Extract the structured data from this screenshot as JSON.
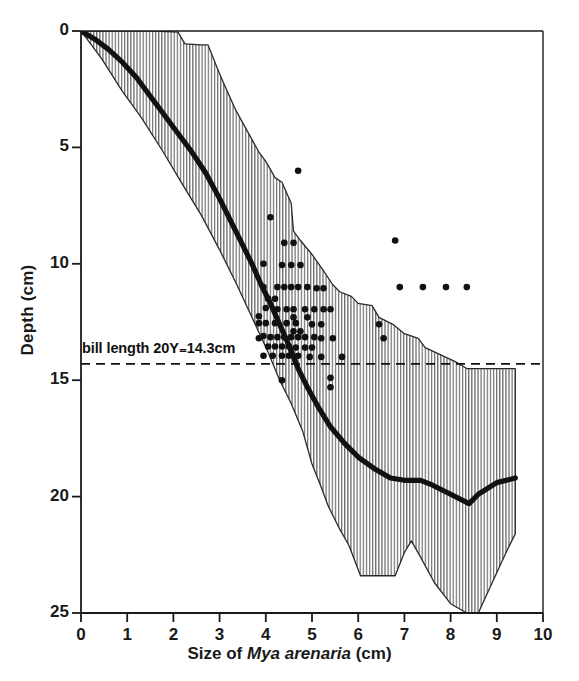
{
  "chart_data": {
    "type": "area",
    "title": "",
    "xlabel": "Size of Mya arenaria (cm)",
    "xlabel_parts": {
      "pre": "Size of ",
      "italic": "Mya arenaria",
      "post": " (cm)"
    },
    "ylabel": "Depth (cm)",
    "xlim": [
      0,
      10
    ],
    "ylim": [
      25,
      0
    ],
    "y_inverted": true,
    "grid": false,
    "legend": null,
    "xticks": [
      0,
      1,
      2,
      3,
      4,
      5,
      6,
      7,
      8,
      9,
      10
    ],
    "xtick_labels": [
      "0",
      "1",
      "2",
      "3",
      "4",
      "5",
      "6",
      "7",
      "8",
      "9",
      "10"
    ],
    "yticks": [
      0,
      5,
      10,
      15,
      20,
      25
    ],
    "ytick_labels": [
      "0",
      "5",
      "10",
      "15",
      "20",
      "25"
    ],
    "annotations": [
      {
        "name": "bill-length-line",
        "text": "bill length 20Y₌14.3cm",
        "type": "hline",
        "y": 14.3,
        "style": "dashed",
        "label_x": 0.05
      }
    ],
    "series": [
      {
        "name": "burial depth envelope (range)",
        "type": "band",
        "fill": "vertical-hatch",
        "upper": [
          [
            0.0,
            0.0
          ],
          [
            1.6,
            0.0
          ],
          [
            2.1,
            0.05
          ],
          [
            2.25,
            0.55
          ],
          [
            2.6,
            0.6
          ],
          [
            2.75,
            0.6
          ],
          [
            2.95,
            1.6
          ],
          [
            3.1,
            2.3
          ],
          [
            3.35,
            3.4
          ],
          [
            3.6,
            4.3
          ],
          [
            3.85,
            5.2
          ],
          [
            4.0,
            5.6
          ],
          [
            4.2,
            6.3
          ],
          [
            4.35,
            6.5
          ],
          [
            4.55,
            7.4
          ],
          [
            4.6,
            8.6
          ],
          [
            4.75,
            9.0
          ],
          [
            5.0,
            9.6
          ],
          [
            5.25,
            10.3
          ],
          [
            5.45,
            10.9
          ],
          [
            5.6,
            11.2
          ],
          [
            5.85,
            11.4
          ],
          [
            6.0,
            11.7
          ],
          [
            6.3,
            11.8
          ],
          [
            6.45,
            12.3
          ],
          [
            6.75,
            12.6
          ],
          [
            7.0,
            13.0
          ],
          [
            7.3,
            13.2
          ],
          [
            7.45,
            13.6
          ],
          [
            8.1,
            14.2
          ],
          [
            8.35,
            14.5
          ],
          [
            9.4,
            14.5
          ]
        ],
        "lower": [
          [
            0.0,
            0.0
          ],
          [
            0.45,
            1.2
          ],
          [
            0.9,
            2.6
          ],
          [
            1.3,
            3.7
          ],
          [
            1.75,
            5.1
          ],
          [
            2.2,
            6.6
          ],
          [
            2.6,
            7.9
          ],
          [
            3.0,
            9.4
          ],
          [
            3.35,
            10.8
          ],
          [
            3.7,
            12.3
          ],
          [
            4.05,
            13.8
          ],
          [
            4.3,
            15.0
          ],
          [
            4.55,
            16.0
          ],
          [
            4.8,
            17.2
          ],
          [
            5.0,
            18.6
          ],
          [
            5.2,
            19.6
          ],
          [
            5.35,
            20.4
          ],
          [
            5.6,
            21.4
          ],
          [
            5.8,
            22.1
          ],
          [
            6.05,
            23.4
          ],
          [
            6.8,
            23.4
          ],
          [
            7.0,
            22.4
          ],
          [
            7.15,
            21.9
          ],
          [
            7.35,
            22.6
          ],
          [
            7.65,
            23.7
          ],
          [
            8.0,
            24.6
          ],
          [
            8.35,
            25.0
          ],
          [
            8.6,
            25.0
          ],
          [
            8.9,
            23.7
          ],
          [
            9.2,
            22.4
          ],
          [
            9.4,
            21.6
          ],
          [
            9.4,
            14.5
          ]
        ]
      },
      {
        "name": "median burial depth",
        "type": "line",
        "linewidth": "thick",
        "color": "#111111",
        "points": [
          [
            0.0,
            0.0
          ],
          [
            0.3,
            0.35
          ],
          [
            0.6,
            0.8
          ],
          [
            0.9,
            1.35
          ],
          [
            1.2,
            2.0
          ],
          [
            1.5,
            2.8
          ],
          [
            1.8,
            3.6
          ],
          [
            2.1,
            4.4
          ],
          [
            2.4,
            5.2
          ],
          [
            2.7,
            6.1
          ],
          [
            3.0,
            7.2
          ],
          [
            3.25,
            8.2
          ],
          [
            3.5,
            9.2
          ],
          [
            3.7,
            10.0
          ],
          [
            3.9,
            10.9
          ],
          [
            4.1,
            11.7
          ],
          [
            4.3,
            12.6
          ],
          [
            4.5,
            13.5
          ],
          [
            4.7,
            14.5
          ],
          [
            4.9,
            15.3
          ],
          [
            5.15,
            16.2
          ],
          [
            5.4,
            17.0
          ],
          [
            5.7,
            17.7
          ],
          [
            6.0,
            18.3
          ],
          [
            6.35,
            18.8
          ],
          [
            6.7,
            19.2
          ],
          [
            7.0,
            19.3
          ],
          [
            7.35,
            19.3
          ],
          [
            7.6,
            19.5
          ],
          [
            8.0,
            19.9
          ],
          [
            8.4,
            20.3
          ],
          [
            8.6,
            19.9
          ],
          [
            9.0,
            19.4
          ],
          [
            9.4,
            19.2
          ]
        ]
      },
      {
        "name": "observations",
        "type": "scatter",
        "marker": "filled-circle",
        "color": "#111111",
        "points": [
          [
            4.7,
            6.0
          ],
          [
            4.1,
            8.0
          ],
          [
            6.8,
            9.0
          ],
          [
            4.4,
            9.1
          ],
          [
            4.6,
            9.1
          ],
          [
            3.95,
            10.0
          ],
          [
            4.35,
            10.05
          ],
          [
            4.55,
            10.05
          ],
          [
            4.75,
            10.05
          ],
          [
            6.9,
            11.0
          ],
          [
            7.4,
            11.0
          ],
          [
            7.9,
            11.0
          ],
          [
            8.35,
            11.0
          ],
          [
            3.95,
            11.0
          ],
          [
            4.25,
            11.0
          ],
          [
            4.4,
            11.0
          ],
          [
            4.55,
            11.0
          ],
          [
            4.7,
            11.0
          ],
          [
            4.9,
            11.0
          ],
          [
            5.1,
            11.05
          ],
          [
            5.25,
            11.05
          ],
          [
            4.05,
            11.5
          ],
          [
            4.2,
            11.5
          ],
          [
            4.0,
            11.9
          ],
          [
            4.25,
            11.95
          ],
          [
            4.45,
            11.95
          ],
          [
            4.6,
            11.95
          ],
          [
            4.85,
            11.95
          ],
          [
            5.05,
            11.95
          ],
          [
            5.25,
            11.95
          ],
          [
            5.4,
            11.95
          ],
          [
            3.85,
            12.25
          ],
          [
            4.6,
            12.3
          ],
          [
            4.9,
            12.3
          ],
          [
            3.85,
            12.55
          ],
          [
            4.0,
            12.55
          ],
          [
            4.2,
            12.55
          ],
          [
            4.45,
            12.55
          ],
          [
            4.65,
            12.55
          ],
          [
            5.0,
            12.6
          ],
          [
            5.2,
            12.6
          ],
          [
            6.45,
            12.6
          ],
          [
            4.6,
            12.9
          ],
          [
            4.75,
            12.9
          ],
          [
            3.95,
            13.1
          ],
          [
            4.1,
            13.15
          ],
          [
            4.25,
            13.15
          ],
          [
            4.4,
            13.15
          ],
          [
            4.55,
            13.15
          ],
          [
            4.7,
            13.15
          ],
          [
            4.85,
            13.15
          ],
          [
            5.05,
            13.15
          ],
          [
            5.2,
            13.2
          ],
          [
            5.45,
            13.2
          ],
          [
            3.85,
            13.2
          ],
          [
            6.55,
            13.2
          ],
          [
            4.05,
            13.55
          ],
          [
            4.2,
            13.55
          ],
          [
            4.35,
            13.55
          ],
          [
            4.5,
            13.55
          ],
          [
            4.65,
            13.6
          ],
          [
            4.85,
            13.6
          ],
          [
            5.0,
            13.6
          ],
          [
            3.95,
            13.95
          ],
          [
            4.15,
            13.95
          ],
          [
            4.35,
            13.95
          ],
          [
            4.5,
            13.95
          ],
          [
            4.7,
            13.95
          ],
          [
            4.95,
            14.0
          ],
          [
            5.2,
            14.0
          ],
          [
            5.65,
            14.0
          ],
          [
            4.35,
            15.0
          ],
          [
            5.4,
            14.9
          ],
          [
            5.4,
            15.3
          ]
        ]
      }
    ]
  },
  "axis": {
    "ylabel": "Depth (cm)",
    "ytick_labels": [
      "0",
      "5",
      "10",
      "15",
      "20",
      "25"
    ],
    "xtick_labels": [
      "0",
      "1",
      "2",
      "3",
      "4",
      "5",
      "6",
      "7",
      "8",
      "9",
      "10"
    ],
    "xlabel_pre": "Size of ",
    "xlabel_italic": "Mya arenaria",
    "xlabel_post": " (cm)"
  },
  "annotation": {
    "bill_length": "bill length 20Y₌14.3cm"
  }
}
